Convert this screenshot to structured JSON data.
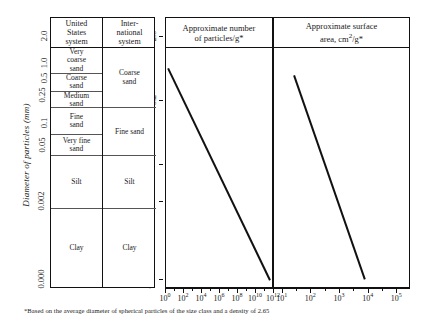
{
  "figure": {
    "y_axis_caption": "Diameter of particles (mm)",
    "footnote": "*Based on the average diameter of spherical particles of the size class and a density of 2.65"
  },
  "scale_outer": {
    "name": "diameter-mm-outer-scale",
    "ticks": [
      {
        "label": "2.0",
        "pos": 0.0
      },
      {
        "label": "1.0",
        "pos": 0.108
      },
      {
        "label": "0.5",
        "pos": 0.168
      },
      {
        "label": "0.25",
        "pos": 0.235
      },
      {
        "label": "0.1",
        "pos": 0.345
      },
      {
        "label": "0.05",
        "pos": 0.432
      },
      {
        "label": "0.002",
        "pos": 0.655
      },
      {
        "label": "0.000",
        "pos": 0.965
      }
    ]
  },
  "scale_inner": {
    "name": "diameter-mm-inner-scale",
    "ticks": [
      {
        "label": "2.0",
        "pos": 0.0
      },
      {
        "label": "0.2",
        "pos": 0.255
      },
      {
        "label": "0.02",
        "pos": 0.508
      },
      {
        "label": "0.002",
        "pos": 0.655
      },
      {
        "label": "0.000",
        "pos": 0.965
      }
    ]
  },
  "classification_table": {
    "headers": [
      "United States system",
      "International system"
    ],
    "header_lines": {
      "us": [
        "United",
        "States",
        "system"
      ],
      "intl": [
        "Inter-",
        "national",
        "system"
      ]
    },
    "us_classes": [
      {
        "label": "Very coarse sand",
        "lines": [
          "Very",
          "coarse",
          "sand"
        ],
        "top": 0.0,
        "bottom": 0.108
      },
      {
        "label": "Coarse sand",
        "lines": [
          "Coarse",
          "sand"
        ],
        "top": 0.108,
        "bottom": 0.185
      },
      {
        "label": "Medium sand",
        "lines": [
          "Medium",
          "sand"
        ],
        "top": 0.185,
        "bottom": 0.252
      },
      {
        "label": "Fine sand",
        "lines": [
          "Fine",
          "sand"
        ],
        "top": 0.252,
        "bottom": 0.362
      },
      {
        "label": "Very fine sand",
        "lines": [
          "Very fine",
          "sand"
        ],
        "top": 0.362,
        "bottom": 0.452
      },
      {
        "label": "Silt",
        "lines": [
          "Silt"
        ],
        "top": 0.452,
        "bottom": 0.672
      },
      {
        "label": "Clay",
        "lines": [
          "Clay"
        ],
        "top": 0.672,
        "bottom": 1.0
      }
    ],
    "intl_classes": [
      {
        "label": "Coarse sand",
        "lines": [
          "Coarse",
          "sand"
        ],
        "top": 0.0,
        "bottom": 0.252
      },
      {
        "label": "Fine sand",
        "lines": [
          "Fine sand"
        ],
        "top": 0.252,
        "bottom": 0.452
      },
      {
        "label": "Silt",
        "lines": [
          "Silt"
        ],
        "top": 0.452,
        "bottom": 0.672
      },
      {
        "label": "Clay",
        "lines": [
          "Clay"
        ],
        "top": 0.672,
        "bottom": 1.0
      }
    ]
  },
  "chart_data": [
    {
      "type": "line",
      "name": "approximate-number-of-particles",
      "title": "Approximate number of particles/g*",
      "title_lines": [
        "Approximate number",
        "of particles/g*"
      ],
      "xlabel": "",
      "ylabel": "Diameter of particles (mm)",
      "xscale": "log",
      "yscale": "log",
      "xlim": [
        1,
        1000000000000
      ],
      "xticks": [
        "10<sup>0</sup>",
        "10<sup>2</sup>",
        "10<sup>4</sup>",
        "10<sup>6</sup>",
        "10<sup>8</sup>",
        "10<sup>10</sup>",
        "10<sup>12</sup>"
      ],
      "xtick_values": [
        1,
        100,
        10000,
        1000000,
        100000000,
        10000000000,
        1000000000000
      ],
      "ylim_mm": [
        0.0001,
        2.0
      ],
      "grid": false,
      "legend": "none",
      "series": [
        {
          "name": "particles per gram",
          "x": [
            90,
            9000000000
          ],
          "y_mm": [
            1.5,
            0.003
          ],
          "x_frac": [
            0.03,
            0.99
          ],
          "y_frac": [
            0.085,
            0.97
          ]
        }
      ]
    },
    {
      "type": "line",
      "name": "approximate-surface-area",
      "title": "Approximate surface area, cm2/g*",
      "title_lines": [
        "Approximate surface",
        "area, cm²/g*"
      ],
      "xlabel": "",
      "ylabel": "Diameter of particles (mm)",
      "xscale": "log",
      "yscale": "log",
      "xlim": [
        5,
        300000
      ],
      "xticks": [
        "10<sup>1</sup>",
        "10<sup>2</sup>",
        "10<sup>3</sup>",
        "10<sup>4</sup>",
        "10<sup>5</sup>"
      ],
      "xtick_values": [
        10,
        100,
        1000,
        10000,
        100000
      ],
      "ylim_mm": [
        0.0001,
        2.0
      ],
      "grid": false,
      "legend": "none",
      "series": [
        {
          "name": "surface area per gram",
          "x": [
            15,
            20000
          ],
          "y_mm": [
            1.3,
            0.003
          ],
          "x_frac": [
            0.155,
            0.68
          ],
          "y_frac": [
            0.115,
            0.97
          ]
        }
      ]
    }
  ]
}
